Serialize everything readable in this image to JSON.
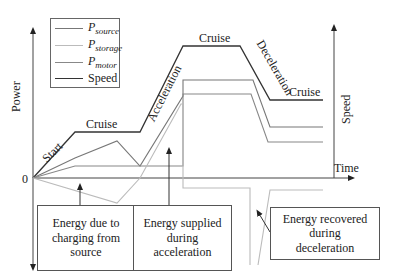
{
  "diagram": {
    "axes": {
      "y_left_label": "Power",
      "y_right_label": "Speed",
      "x_label": "Time",
      "zero_label": "0"
    },
    "legend": [
      {
        "symbol": "P",
        "subscript": "source",
        "color": "#777777"
      },
      {
        "symbol": "P",
        "subscript": "storage",
        "color": "#bbbbbb"
      },
      {
        "symbol": "P",
        "subscript": "motor",
        "color": "#888888"
      },
      {
        "symbol": "",
        "subscript": "",
        "label": "Speed",
        "color": "#333333"
      }
    ],
    "phases": [
      "Start",
      "Cruise",
      "Acceleration",
      "Cruise",
      "Deceleration",
      "Cruise"
    ],
    "annotations": [
      "Energy due to charging from source",
      "Energy supplied during acceleration",
      "Energy recovered during deceleration"
    ],
    "annotation_lines": [
      [
        "Energy due to",
        "charging from",
        "source"
      ],
      [
        "Energy supplied",
        "during",
        "acceleration"
      ],
      [
        "Energy recovered",
        "during",
        "deceleration"
      ]
    ]
  }
}
